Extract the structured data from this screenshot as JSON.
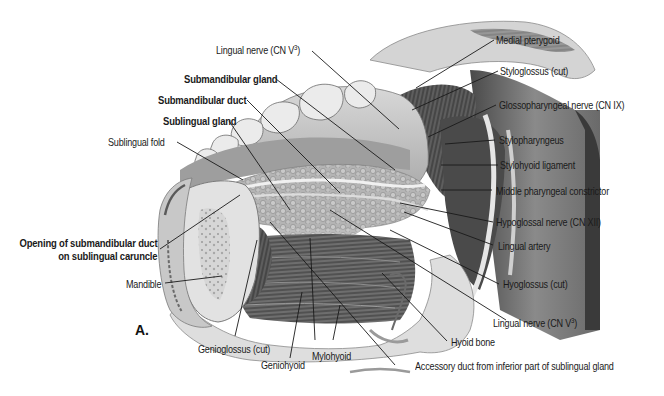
{
  "figure": {
    "panel_letter": "A."
  },
  "labels": {
    "lingual_nerve_top": {
      "text": "Lingual nerve (CN V",
      "sup": "3",
      "close": ")"
    },
    "submandibular_gland": "Submandibular gland",
    "submandibular_duct": "Submandibular duct",
    "sublingual_gland": "Sublingual gland",
    "sublingual_fold": "Sublingual fold",
    "opening_line1": "Opening of submandibular duct",
    "opening_line2": "on sublingual caruncle",
    "mandible": "Mandible",
    "genioglossus": "Genioglossus (cut)",
    "geniohyoid": "Geniohyoid",
    "mylohyoid": "Mylohyoid",
    "accessory_duct": "Accessory duct from inferior part of sublingual gland",
    "hyoid_bone": "Hyoid bone",
    "lingual_nerve_bottom": {
      "text": "Lingual nerve (CN V",
      "sup": "3",
      "close": ")"
    },
    "hyoglossus": "Hyoglossus (cut)",
    "lingual_artery": "Lingual artery",
    "hypoglossal_nerve": "Hypoglossal nerve (CN XII)",
    "middle_pharyngeal_constrictor": "Middle pharyngeal constrictor",
    "stylohyoid_ligament": "Stylohyoid ligament",
    "stylopharyngeus": "Stylopharyngeus",
    "glossopharyngeal_nerve": "Glossopharyngeal nerve (CN IX)",
    "styloglossus": "Styloglossus (cut)",
    "medial_pterygoid": "Medial pterygoid"
  },
  "colors": {
    "background": "#ffffff",
    "text": "#1a1a1a",
    "leader_line": "#1a1a1a",
    "tissue_light": "#e4e4e4",
    "tissue_mid": "#b8b8b8",
    "tissue_dark": "#5a5a5a",
    "muscle_dark": "#3a3a3a"
  }
}
